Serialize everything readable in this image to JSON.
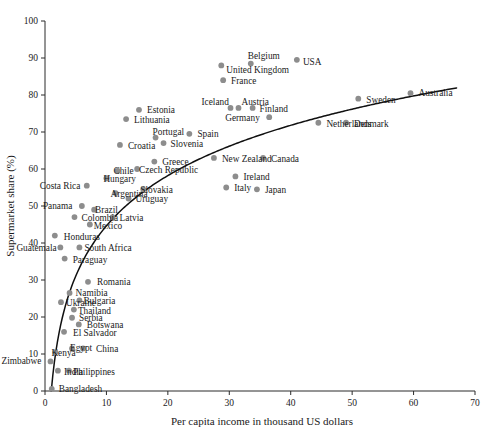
{
  "chart_data": {
    "type": "scatter",
    "title": "",
    "xlabel": "Per capita income in thousand US dollars",
    "ylabel": "Supermarket share (%)",
    "xlim": [
      0,
      70
    ],
    "ylim": [
      0,
      100
    ],
    "xticks": [
      0,
      10,
      20,
      30,
      40,
      50,
      60,
      70
    ],
    "yticks": [
      0,
      10,
      20,
      30,
      40,
      50,
      60,
      70,
      80,
      90,
      100
    ],
    "grid": false,
    "legend": "none",
    "marker_color": "#8d8d8d",
    "trend_color": "#101010",
    "trend_note": "logarithmic best-fit curve rising from lower-left to upper-right",
    "points": [
      {
        "label": "Bangladesh",
        "x": 1.1,
        "y": 0.6,
        "label_dx": 7,
        "label_dy": 3
      },
      {
        "label": "Zimbabwe",
        "x": 0.9,
        "y": 8.0,
        "label_dx": -49,
        "label_dy": 3
      },
      {
        "label": "India",
        "x": 2.1,
        "y": 5.5,
        "label_dx": 6,
        "label_dy": 4
      },
      {
        "label": "Philippines",
        "x": 3.9,
        "y": 5.5,
        "label_dx": 4,
        "label_dy": 4
      },
      {
        "label": "Kenya",
        "x": 1.7,
        "y": 10.5,
        "label_dx": -4,
        "label_dy": 4
      },
      {
        "label": "Egypt",
        "x": 4.4,
        "y": 11.5,
        "label_dx": -2,
        "label_dy": 3
      },
      {
        "label": "China",
        "x": 6.2,
        "y": 11.5,
        "label_dx": 13,
        "label_dy": 4
      },
      {
        "label": "El Salvador",
        "x": 3.1,
        "y": 16.0,
        "label_dx": 9,
        "label_dy": 4
      },
      {
        "label": "Botswana",
        "x": 5.5,
        "y": 18.0,
        "label_dx": 8,
        "label_dy": 4
      },
      {
        "label": "Serbia",
        "x": 4.4,
        "y": 19.8,
        "label_dx": 7,
        "label_dy": 3
      },
      {
        "label": "Thailand",
        "x": 4.7,
        "y": 22.0,
        "label_dx": 4,
        "label_dy": 4
      },
      {
        "label": "Ukraine",
        "x": 2.6,
        "y": 24.0,
        "label_dx": 5,
        "label_dy": 4
      },
      {
        "label": "Bulgaria",
        "x": 5.6,
        "y": 24.5,
        "label_dx": 4,
        "label_dy": 4
      },
      {
        "label": "Namibia",
        "x": 4.0,
        "y": 26.5,
        "label_dx": 6,
        "label_dy": 3
      },
      {
        "label": "Romania",
        "x": 7.0,
        "y": 29.5,
        "label_dx": 9,
        "label_dy": 3
      },
      {
        "label": "Paraguay",
        "x": 3.2,
        "y": 35.8,
        "label_dx": 8,
        "label_dy": 4
      },
      {
        "label": "Guatemala",
        "x": 2.5,
        "y": 38.8,
        "label_dx": -44,
        "label_dy": 4
      },
      {
        "label": "South Africa",
        "x": 5.6,
        "y": 38.8,
        "label_dx": 5,
        "label_dy": 4
      },
      {
        "label": "Honduras",
        "x": 1.6,
        "y": 42.0,
        "label_dx": 9,
        "label_dy": 4
      },
      {
        "label": "Mexico",
        "x": 7.3,
        "y": 45.0,
        "label_dx": 4,
        "label_dy": 4
      },
      {
        "label": "Colombia",
        "x": 4.8,
        "y": 47.0,
        "label_dx": 7,
        "label_dy": 4
      },
      {
        "label": "Latvia",
        "x": 11.0,
        "y": 47.0,
        "label_dx": 7,
        "label_dy": 4
      },
      {
        "label": "Brazil",
        "x": 8.0,
        "y": 49.0,
        "label_dx": 1,
        "label_dy": 3
      },
      {
        "label": "Panama",
        "x": 6.0,
        "y": 50.0,
        "label_dx": -39,
        "label_dy": 3
      },
      {
        "label": "Uruguay",
        "x": 13.6,
        "y": 52.0,
        "label_dx": 7,
        "label_dy": 3
      },
      {
        "label": "Argentina",
        "x": 11.5,
        "y": 53.5,
        "label_dx": -5,
        "label_dy": 4
      },
      {
        "label": "Slovakia",
        "x": 16.0,
        "y": 54.5,
        "label_dx": -3,
        "label_dy": 4
      },
      {
        "label": "Costa Rica",
        "x": 6.8,
        "y": 55.5,
        "label_dx": -47,
        "label_dy": 3
      },
      {
        "label": "Hungary",
        "x": 10.0,
        "y": 57.5,
        "label_dx": -3,
        "label_dy": 4
      },
      {
        "label": "Chile",
        "x": 11.8,
        "y": 59.5,
        "label_dx": -4,
        "label_dy": 3
      },
      {
        "label": "Czech Republic",
        "x": 15.0,
        "y": 60.0,
        "label_dx": 2,
        "label_dy": 4
      },
      {
        "label": "Greece",
        "x": 17.8,
        "y": 62.0,
        "label_dx": 8,
        "label_dy": 3
      },
      {
        "label": "Italy",
        "x": 29.5,
        "y": 55.0,
        "label_dx": 8,
        "label_dy": 3
      },
      {
        "label": "Croatia",
        "x": 12.2,
        "y": 66.5,
        "label_dx": 8,
        "label_dy": 4
      },
      {
        "label": "Slovenia",
        "x": 19.3,
        "y": 67.0,
        "label_dx": 7,
        "label_dy": 4
      },
      {
        "label": "Portugal",
        "x": 18.0,
        "y": 68.5,
        "label_dx": -3,
        "label_dy": -3
      },
      {
        "label": "Spain",
        "x": 23.5,
        "y": 69.5,
        "label_dx": 8,
        "label_dy": 3
      },
      {
        "label": "Lithuania",
        "x": 13.2,
        "y": 73.5,
        "label_dx": 8,
        "label_dy": 4
      },
      {
        "label": "Estonia",
        "x": 15.3,
        "y": 76.0,
        "label_dx": 8,
        "label_dy": 3
      },
      {
        "label": "New Zealand",
        "x": 27.5,
        "y": 63.0,
        "label_dx": 8,
        "label_dy": 4
      },
      {
        "label": "Canada",
        "x": 35.5,
        "y": 63.0,
        "label_dx": 8,
        "label_dy": 4
      },
      {
        "label": "Japan",
        "x": 34.5,
        "y": 54.5,
        "label_dx": 8,
        "label_dy": 4
      },
      {
        "label": "Ireland",
        "x": 31.0,
        "y": 58.0,
        "label_dx": 8,
        "label_dy": 4
      },
      {
        "label": "Netherlands",
        "x": 44.5,
        "y": 72.5,
        "label_dx": 8,
        "label_dy": 4
      },
      {
        "label": "Denmark",
        "x": 49.0,
        "y": 72.5,
        "label_dx": 8,
        "label_dy": 4
      },
      {
        "label": "Germany",
        "x": 36.5,
        "y": 74.0,
        "label_dx": -44,
        "label_dy": 4
      },
      {
        "label": "Finland",
        "x": 33.8,
        "y": 76.5,
        "label_dx": 7,
        "label_dy": 4
      },
      {
        "label": "Austria",
        "x": 31.5,
        "y": 76.5,
        "label_dx": 3,
        "label_dy": -3
      },
      {
        "label": "Iceland",
        "x": 30.2,
        "y": 76.5,
        "label_dx": -29,
        "label_dy": -3
      },
      {
        "label": "Sweden",
        "x": 51.0,
        "y": 79.0,
        "label_dx": 8,
        "label_dy": 4
      },
      {
        "label": "Australia",
        "x": 59.5,
        "y": 80.5,
        "label_dx": 8,
        "label_dy": 3
      },
      {
        "label": "France",
        "x": 29.0,
        "y": 84.0,
        "label_dx": 8,
        "label_dy": 4
      },
      {
        "label": "United Kingdom",
        "x": 28.7,
        "y": 88.0,
        "label_dx": 5,
        "label_dy": 8
      },
      {
        "label": "Belgium",
        "x": 33.5,
        "y": 88.5,
        "label_dx": -3,
        "label_dy": -5
      },
      {
        "label": "USA",
        "x": 41.0,
        "y": 89.5,
        "label_dx": 6,
        "label_dy": 5
      }
    ]
  },
  "chart": {
    "x_axis_label": "Per capita income in thousand US dollars",
    "y_axis_label": "Supermarket share (%)"
  }
}
